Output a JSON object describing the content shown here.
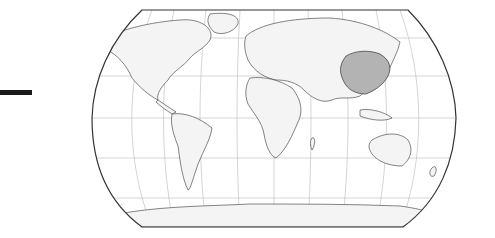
{
  "map": {
    "type": "world-locator",
    "projection": "Robinson",
    "highlighted_region": "China",
    "colors": {
      "highlight": "#b3b3b3",
      "land": "#f4f4f4",
      "border": "#333333",
      "graticule": "#b8b8b8",
      "background": "#ffffff",
      "marker_bar": "#1a1a1a"
    }
  }
}
